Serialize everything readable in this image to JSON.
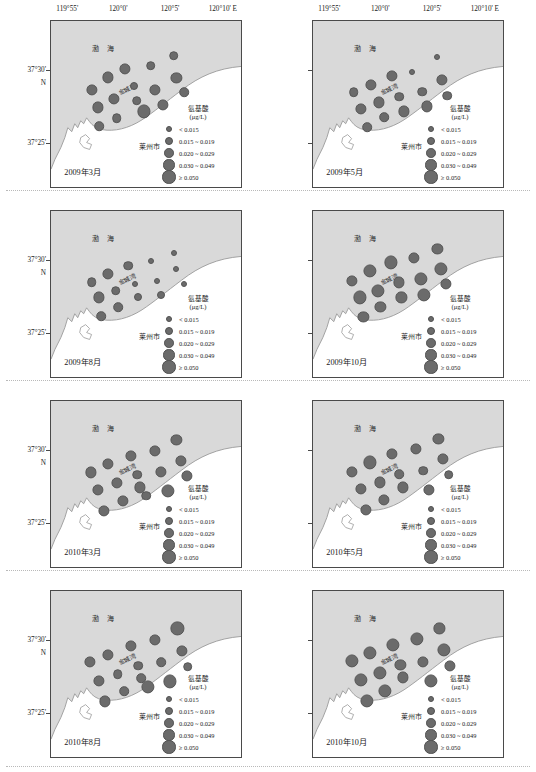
{
  "figure": {
    "type": "multi-panel-bubble-map",
    "columns": 2,
    "rows": 4
  },
  "axes": {
    "longitude_ticks": [
      "119°55'",
      "120°0'",
      "120°5'",
      "120°10' E"
    ],
    "longitude_positions": [
      0.09,
      0.355,
      0.625,
      0.9
    ],
    "latitude_ticks": [
      "37°30'",
      "37°25'"
    ],
    "latitude_hemisphere": "N",
    "latitude_positions": [
      0.295,
      0.735
    ]
  },
  "map_labels": {
    "sea": "渤 海",
    "bay": "金城湾",
    "city": "莱州市"
  },
  "legend": {
    "title_line1": "氨基酸",
    "title_line2": "(μg/L)",
    "entries": [
      {
        "label": "< 0.015",
        "size": 4.0
      },
      {
        "label": "0.015 ~ 0.019",
        "size": 6.0
      },
      {
        "label": "0.020 ~ 0.029",
        "size": 7.6
      },
      {
        "label": "0.030 ~ 0.049",
        "size": 9.2
      },
      {
        "label": "≥ 0.050",
        "size": 11.2
      }
    ]
  },
  "colors": {
    "sea_fill": "#d9d9d9",
    "land_fill": "#ffffff",
    "bubble_fill": "#6b6b6b",
    "bubble_stroke": "#565656",
    "frame_stroke": "#4a4a4a",
    "coastline": "#9a9a9a"
  },
  "chart_data": {
    "type": "scatter",
    "title": "",
    "xlabel": "Longitude (E)",
    "ylabel": "Latitude (N)",
    "xlim": [
      119.9166,
      120.1666
    ],
    "ylim": [
      37.385,
      37.545
    ],
    "grid": false,
    "legend_position": "inside-bottom-right",
    "value_units": "μg/L",
    "size_bins": [
      "< 0.015",
      "0.015 ~ 0.019",
      "0.020 ~ 0.029",
      "0.030 ~ 0.049",
      "≥ 0.050"
    ],
    "panels": [
      {
        "id": "p1",
        "label": "2009年3月",
        "row": 0,
        "col": 0,
        "points": [
          {
            "x": 0.215,
            "y": 0.415,
            "bin": 3
          },
          {
            "x": 0.3,
            "y": 0.34,
            "bin": 3
          },
          {
            "x": 0.39,
            "y": 0.29,
            "bin": 3
          },
          {
            "x": 0.525,
            "y": 0.27,
            "bin": 2
          },
          {
            "x": 0.645,
            "y": 0.208,
            "bin": 2
          },
          {
            "x": 0.66,
            "y": 0.345,
            "bin": 3
          },
          {
            "x": 0.435,
            "y": 0.39,
            "bin": 1
          },
          {
            "x": 0.548,
            "y": 0.415,
            "bin": 3
          },
          {
            "x": 0.7,
            "y": 0.43,
            "bin": 2
          },
          {
            "x": 0.245,
            "y": 0.52,
            "bin": 3
          },
          {
            "x": 0.33,
            "y": 0.47,
            "bin": 3
          },
          {
            "x": 0.45,
            "y": 0.48,
            "bin": 2
          },
          {
            "x": 0.49,
            "y": 0.545,
            "bin": 4
          },
          {
            "x": 0.59,
            "y": 0.505,
            "bin": 3
          },
          {
            "x": 0.345,
            "y": 0.585,
            "bin": 2
          },
          {
            "x": 0.255,
            "y": 0.635,
            "bin": 2
          }
        ]
      },
      {
        "id": "p2",
        "label": "2009年5月",
        "row": 0,
        "col": 1,
        "points": [
          {
            "x": 0.215,
            "y": 0.43,
            "bin": 2
          },
          {
            "x": 0.305,
            "y": 0.385,
            "bin": 3
          },
          {
            "x": 0.415,
            "y": 0.33,
            "bin": 3
          },
          {
            "x": 0.52,
            "y": 0.305,
            "bin": 0
          },
          {
            "x": 0.65,
            "y": 0.215,
            "bin": 0
          },
          {
            "x": 0.68,
            "y": 0.355,
            "bin": 3
          },
          {
            "x": 0.455,
            "y": 0.455,
            "bin": 2
          },
          {
            "x": 0.575,
            "y": 0.425,
            "bin": 2
          },
          {
            "x": 0.705,
            "y": 0.45,
            "bin": 2
          },
          {
            "x": 0.25,
            "y": 0.53,
            "bin": 3
          },
          {
            "x": 0.345,
            "y": 0.49,
            "bin": 3
          },
          {
            "x": 0.48,
            "y": 0.545,
            "bin": 3
          },
          {
            "x": 0.6,
            "y": 0.515,
            "bin": 3
          },
          {
            "x": 0.375,
            "y": 0.58,
            "bin": 2
          },
          {
            "x": 0.285,
            "y": 0.64,
            "bin": 2
          }
        ]
      },
      {
        "id": "p3",
        "label": "2009年8月",
        "row": 1,
        "col": 0,
        "points": [
          {
            "x": 0.215,
            "y": 0.43,
            "bin": 2
          },
          {
            "x": 0.3,
            "y": 0.38,
            "bin": 3
          },
          {
            "x": 0.405,
            "y": 0.33,
            "bin": 2
          },
          {
            "x": 0.525,
            "y": 0.3,
            "bin": 0
          },
          {
            "x": 0.645,
            "y": 0.25,
            "bin": 0
          },
          {
            "x": 0.66,
            "y": 0.35,
            "bin": 0
          },
          {
            "x": 0.44,
            "y": 0.44,
            "bin": 0
          },
          {
            "x": 0.56,
            "y": 0.42,
            "bin": 0
          },
          {
            "x": 0.7,
            "y": 0.44,
            "bin": 0
          },
          {
            "x": 0.25,
            "y": 0.52,
            "bin": 3
          },
          {
            "x": 0.34,
            "y": 0.48,
            "bin": 2
          },
          {
            "x": 0.46,
            "y": 0.52,
            "bin": 1
          },
          {
            "x": 0.58,
            "y": 0.505,
            "bin": 1
          },
          {
            "x": 0.355,
            "y": 0.58,
            "bin": 2
          },
          {
            "x": 0.265,
            "y": 0.635,
            "bin": 2
          }
        ]
      },
      {
        "id": "p4",
        "label": "2009年10月",
        "row": 1,
        "col": 1,
        "points": [
          {
            "x": 0.205,
            "y": 0.42,
            "bin": 3
          },
          {
            "x": 0.3,
            "y": 0.36,
            "bin": 4
          },
          {
            "x": 0.41,
            "y": 0.31,
            "bin": 4
          },
          {
            "x": 0.53,
            "y": 0.285,
            "bin": 3
          },
          {
            "x": 0.655,
            "y": 0.23,
            "bin": 3
          },
          {
            "x": 0.675,
            "y": 0.35,
            "bin": 4
          },
          {
            "x": 0.45,
            "y": 0.43,
            "bin": 3
          },
          {
            "x": 0.57,
            "y": 0.41,
            "bin": 4
          },
          {
            "x": 0.7,
            "y": 0.44,
            "bin": 3
          },
          {
            "x": 0.245,
            "y": 0.52,
            "bin": 4
          },
          {
            "x": 0.34,
            "y": 0.48,
            "bin": 4
          },
          {
            "x": 0.465,
            "y": 0.52,
            "bin": 3
          },
          {
            "x": 0.585,
            "y": 0.505,
            "bin": 4
          },
          {
            "x": 0.355,
            "y": 0.58,
            "bin": 3
          },
          {
            "x": 0.265,
            "y": 0.64,
            "bin": 3
          }
        ]
      },
      {
        "id": "p5",
        "label": "2010年3月",
        "row": 2,
        "col": 0,
        "points": [
          {
            "x": 0.21,
            "y": 0.43,
            "bin": 3
          },
          {
            "x": 0.3,
            "y": 0.38,
            "bin": 3
          },
          {
            "x": 0.42,
            "y": 0.33,
            "bin": 3
          },
          {
            "x": 0.545,
            "y": 0.3,
            "bin": 3
          },
          {
            "x": 0.66,
            "y": 0.235,
            "bin": 3
          },
          {
            "x": 0.685,
            "y": 0.36,
            "bin": 3
          },
          {
            "x": 0.455,
            "y": 0.445,
            "bin": 2
          },
          {
            "x": 0.58,
            "y": 0.425,
            "bin": 3
          },
          {
            "x": 0.715,
            "y": 0.45,
            "bin": 3
          },
          {
            "x": 0.245,
            "y": 0.535,
            "bin": 3
          },
          {
            "x": 0.345,
            "y": 0.495,
            "bin": 3
          },
          {
            "x": 0.47,
            "y": 0.52,
            "bin": 3
          },
          {
            "x": 0.5,
            "y": 0.57,
            "bin": 2
          },
          {
            "x": 0.615,
            "y": 0.54,
            "bin": 4
          },
          {
            "x": 0.38,
            "y": 0.6,
            "bin": 3
          },
          {
            "x": 0.28,
            "y": 0.66,
            "bin": 3
          }
        ]
      },
      {
        "id": "p6",
        "label": "2010年5月",
        "row": 2,
        "col": 1,
        "points": [
          {
            "x": 0.205,
            "y": 0.425,
            "bin": 3
          },
          {
            "x": 0.3,
            "y": 0.37,
            "bin": 4
          },
          {
            "x": 0.415,
            "y": 0.32,
            "bin": 3
          },
          {
            "x": 0.54,
            "y": 0.29,
            "bin": 3
          },
          {
            "x": 0.66,
            "y": 0.23,
            "bin": 3
          },
          {
            "x": 0.685,
            "y": 0.35,
            "bin": 3
          },
          {
            "x": 0.455,
            "y": 0.44,
            "bin": 2
          },
          {
            "x": 0.58,
            "y": 0.42,
            "bin": 2
          },
          {
            "x": 0.715,
            "y": 0.445,
            "bin": 2
          },
          {
            "x": 0.25,
            "y": 0.53,
            "bin": 3
          },
          {
            "x": 0.35,
            "y": 0.49,
            "bin": 3
          },
          {
            "x": 0.475,
            "y": 0.52,
            "bin": 3
          },
          {
            "x": 0.61,
            "y": 0.535,
            "bin": 3
          },
          {
            "x": 0.375,
            "y": 0.595,
            "bin": 3
          },
          {
            "x": 0.28,
            "y": 0.655,
            "bin": 3
          }
        ]
      },
      {
        "id": "p7",
        "label": "2010年8月",
        "row": 3,
        "col": 0,
        "points": [
          {
            "x": 0.205,
            "y": 0.425,
            "bin": 3
          },
          {
            "x": 0.3,
            "y": 0.385,
            "bin": 3
          },
          {
            "x": 0.42,
            "y": 0.33,
            "bin": 3
          },
          {
            "x": 0.545,
            "y": 0.295,
            "bin": 3
          },
          {
            "x": 0.665,
            "y": 0.225,
            "bin": 4
          },
          {
            "x": 0.69,
            "y": 0.36,
            "bin": 3
          },
          {
            "x": 0.46,
            "y": 0.45,
            "bin": 2
          },
          {
            "x": 0.58,
            "y": 0.43,
            "bin": 2
          },
          {
            "x": 0.72,
            "y": 0.455,
            "bin": 2
          },
          {
            "x": 0.25,
            "y": 0.54,
            "bin": 3
          },
          {
            "x": 0.35,
            "y": 0.5,
            "bin": 2
          },
          {
            "x": 0.475,
            "y": 0.525,
            "bin": 2
          },
          {
            "x": 0.51,
            "y": 0.58,
            "bin": 4
          },
          {
            "x": 0.625,
            "y": 0.545,
            "bin": 4
          },
          {
            "x": 0.385,
            "y": 0.605,
            "bin": 2
          },
          {
            "x": 0.285,
            "y": 0.665,
            "bin": 3
          }
        ]
      },
      {
        "id": "p8",
        "label": "2010年10月",
        "row": 3,
        "col": 1,
        "points": [
          {
            "x": 0.205,
            "y": 0.42,
            "bin": 4
          },
          {
            "x": 0.3,
            "y": 0.375,
            "bin": 4
          },
          {
            "x": 0.42,
            "y": 0.325,
            "bin": 4
          },
          {
            "x": 0.545,
            "y": 0.29,
            "bin": 4
          },
          {
            "x": 0.665,
            "y": 0.225,
            "bin": 3
          },
          {
            "x": 0.69,
            "y": 0.355,
            "bin": 4
          },
          {
            "x": 0.46,
            "y": 0.445,
            "bin": 3
          },
          {
            "x": 0.58,
            "y": 0.425,
            "bin": 3
          },
          {
            "x": 0.72,
            "y": 0.45,
            "bin": 3
          },
          {
            "x": 0.25,
            "y": 0.535,
            "bin": 4
          },
          {
            "x": 0.35,
            "y": 0.495,
            "bin": 4
          },
          {
            "x": 0.475,
            "y": 0.52,
            "bin": 3
          },
          {
            "x": 0.62,
            "y": 0.54,
            "bin": 4
          },
          {
            "x": 0.38,
            "y": 0.6,
            "bin": 4
          },
          {
            "x": 0.285,
            "y": 0.66,
            "bin": 4
          }
        ]
      }
    ]
  }
}
